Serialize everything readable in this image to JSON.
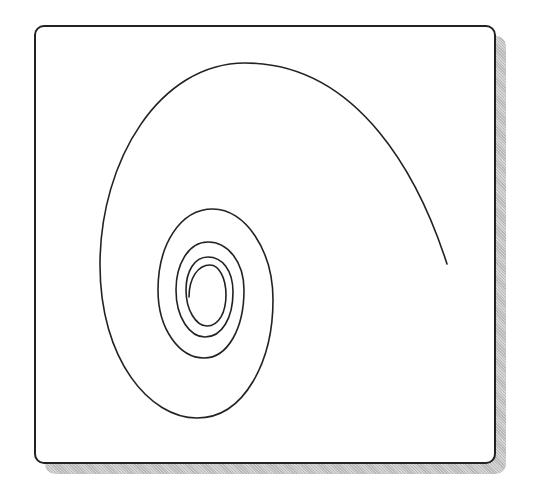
{
  "diagram": {
    "type": "spiral",
    "colors": {
      "stroke": "#222222",
      "frame_border": "#222222",
      "background": "#ffffff",
      "shadow": "#c4c4c4"
    },
    "turns": 4,
    "outer_end": [
      447,
      264
    ],
    "inner_start": [
      189,
      297
    ]
  }
}
